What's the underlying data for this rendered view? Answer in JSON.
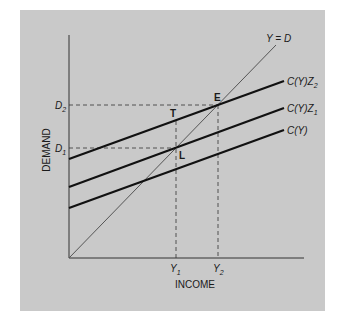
{
  "diagram": {
    "axes": {
      "x_label": "INCOME",
      "y_label": "DEMAND"
    },
    "ticks": {
      "y": [
        {
          "main": "D",
          "sub": "2"
        },
        {
          "main": "D",
          "sub": "1"
        }
      ],
      "x": [
        {
          "main": "Y",
          "sub": "1"
        },
        {
          "main": "Y",
          "sub": "2"
        }
      ]
    },
    "lines": {
      "guide": "Y = D",
      "c_z2": {
        "main": "C(Y)Z",
        "sub": "2"
      },
      "c_z1": {
        "main": "C(Y)Z",
        "sub": "1"
      },
      "c": "C(Y)"
    },
    "points": {
      "E": "E",
      "T": "T",
      "L": "L"
    },
    "colors": {
      "background": "#c9c9c9",
      "lines": "#111111",
      "guide": "#555555"
    }
  }
}
